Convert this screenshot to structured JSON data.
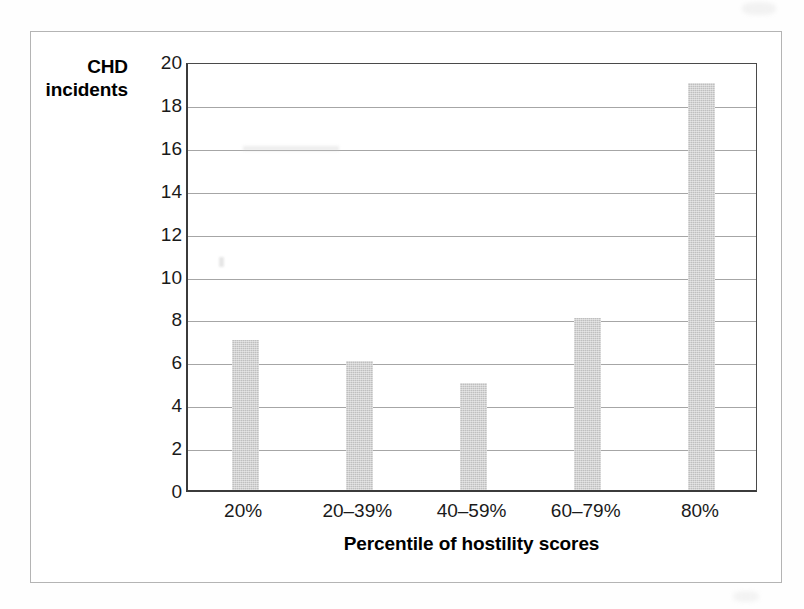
{
  "chart_data": {
    "type": "bar",
    "title": "",
    "subtitle": "",
    "xlabel": "Percentile of hostility scores",
    "ylabel": "CHD incidents",
    "ylabel_lines": [
      "CHD",
      "incidents"
    ],
    "categories": [
      "20%",
      "20–39%",
      "40–59%",
      "60–79%",
      "80%"
    ],
    "values": [
      7,
      6,
      5,
      8,
      19
    ],
    "series": [
      {
        "name": "CHD incidents",
        "values": [
          7,
          6,
          5,
          8,
          19
        ]
      }
    ],
    "ylim": [
      0,
      20
    ],
    "ytick_labels": [
      "0",
      "2",
      "4",
      "6",
      "8",
      "10",
      "12",
      "14",
      "16",
      "18",
      "20"
    ],
    "ytick_values": [
      0,
      2,
      4,
      6,
      8,
      10,
      12,
      14,
      16,
      18,
      20
    ],
    "grid": "horizontal",
    "legend": "none",
    "annotations": [],
    "colors": {
      "bar_fill": "#bfbfbf",
      "gridline": "#a6a6a6",
      "axis_line": "#3b3b3b",
      "text": "#1a1a1a",
      "page_border": "#b4b4b4",
      "background": "#ffffff"
    }
  }
}
